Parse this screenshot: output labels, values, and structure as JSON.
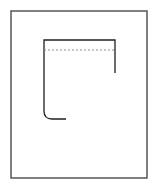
{
  "figure": {
    "canvas": {
      "width": 158,
      "height": 192,
      "background_color": "#ffffff"
    },
    "frame": {
      "name": "outer-border",
      "x": 11,
      "y": 11,
      "width": 136,
      "height": 167,
      "stroke_color": "#4a4a4a",
      "stroke_width": 1.4,
      "fill": "none"
    },
    "profile": {
      "name": "profile-outline",
      "stroke_color": "#1f1f1f",
      "stroke_width": 1.3,
      "fill": "none",
      "left_x": 44,
      "right_x": 115,
      "top_y": 40,
      "bottom_y": 119,
      "bottom_end_x": 66,
      "right_end_y": 73,
      "corner_radius": 8,
      "path": "M 115 73 L 115 40 L 44 40 L 44 111 Q 44 119 52 119 L 66 119"
    },
    "hidden_line": {
      "name": "dashed-hidden-line",
      "x1": 44,
      "y1": 50,
      "x2": 115,
      "y2": 50,
      "stroke_color": "#8a8a8a",
      "stroke_width": 1,
      "dash_pattern": "2 2"
    }
  }
}
